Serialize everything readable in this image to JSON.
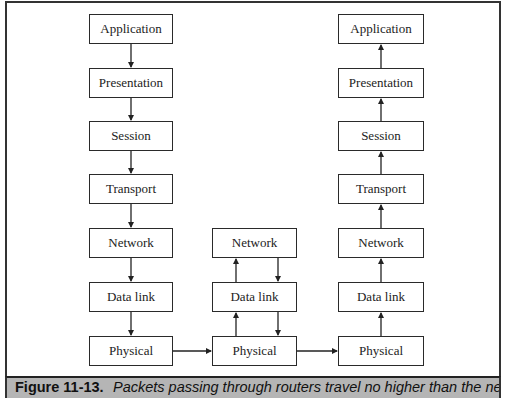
{
  "figure": {
    "label": "Figure 11-13.",
    "caption": "Packets passing through routers travel no higher than the network"
  },
  "stacks": {
    "sender": [
      "Application",
      "Presentation",
      "Session",
      "Transport",
      "Network",
      "Data link",
      "Physical"
    ],
    "router": [
      "Network",
      "Data link",
      "Physical"
    ],
    "receiver": [
      "Application",
      "Presentation",
      "Session",
      "Transport",
      "Network",
      "Data link",
      "Physical"
    ]
  },
  "flow": {
    "sender": "down",
    "router": "up-and-down",
    "receiver": "up",
    "links": [
      "sender-physical to router-physical",
      "router-physical to receiver-physical"
    ]
  }
}
